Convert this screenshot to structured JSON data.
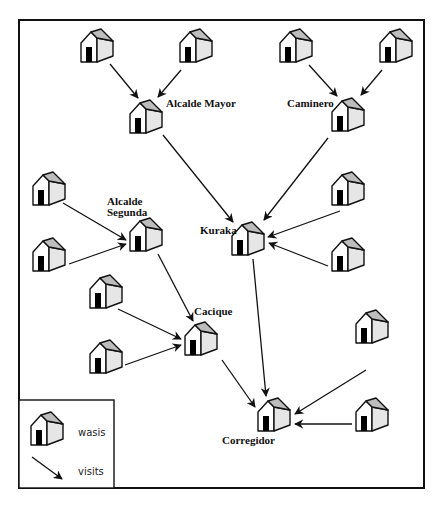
{
  "diagram": {
    "type": "network-flow",
    "colors": {
      "stroke": "#111111",
      "roof": "#bdbdbd",
      "side": "#e6e6e6",
      "door": "#000000",
      "background": "#ffffff"
    },
    "nodes": [
      {
        "id": "w1",
        "kind": "wasi",
        "x": 81,
        "y": 29
      },
      {
        "id": "w2",
        "kind": "wasi",
        "x": 180,
        "y": 29
      },
      {
        "id": "w3",
        "kind": "wasi",
        "x": 280,
        "y": 29
      },
      {
        "id": "w4",
        "kind": "wasi",
        "x": 380,
        "y": 29
      },
      {
        "id": "alcalde_mayor",
        "kind": "wasi",
        "x": 130,
        "y": 100,
        "label": "Alcalde Mayor"
      },
      {
        "id": "caminero",
        "kind": "wasi",
        "x": 332,
        "y": 98,
        "label": "Caminero"
      },
      {
        "id": "w5",
        "kind": "wasi",
        "x": 33,
        "y": 172
      },
      {
        "id": "w6",
        "kind": "wasi",
        "x": 33,
        "y": 238
      },
      {
        "id": "alcalde_segunda",
        "kind": "wasi",
        "x": 130,
        "y": 218,
        "label": "Alcalde Segunda"
      },
      {
        "id": "kuraka",
        "kind": "wasi",
        "x": 232,
        "y": 222,
        "label": "Kuraka"
      },
      {
        "id": "w7",
        "kind": "wasi",
        "x": 332,
        "y": 172
      },
      {
        "id": "w8",
        "kind": "wasi",
        "x": 332,
        "y": 238
      },
      {
        "id": "w9",
        "kind": "wasi",
        "x": 90,
        "y": 275
      },
      {
        "id": "w10",
        "kind": "wasi",
        "x": 90,
        "y": 340
      },
      {
        "id": "cacique",
        "kind": "wasi",
        "x": 185,
        "y": 322,
        "label": "Cacique"
      },
      {
        "id": "w11",
        "kind": "wasi",
        "x": 356,
        "y": 310
      },
      {
        "id": "w12",
        "kind": "wasi",
        "x": 356,
        "y": 398
      },
      {
        "id": "corregidor",
        "kind": "wasi",
        "x": 258,
        "y": 398,
        "label": "Corregidor"
      }
    ],
    "edges": [
      {
        "from": "w1",
        "to": "alcalde_mayor",
        "x1": 110,
        "y1": 64,
        "x2": 138,
        "y2": 98
      },
      {
        "from": "w2",
        "to": "alcalde_mayor",
        "x1": 181,
        "y1": 70,
        "x2": 158,
        "y2": 97
      },
      {
        "from": "w3",
        "to": "caminero",
        "x1": 309,
        "y1": 65,
        "x2": 337,
        "y2": 96
      },
      {
        "from": "w4",
        "to": "caminero",
        "x1": 382,
        "y1": 70,
        "x2": 361,
        "y2": 95
      },
      {
        "from": "alcalde_mayor",
        "to": "kuraka",
        "x1": 163,
        "y1": 135,
        "x2": 233,
        "y2": 222
      },
      {
        "from": "caminero",
        "to": "kuraka",
        "x1": 328,
        "y1": 138,
        "x2": 264,
        "y2": 220
      },
      {
        "from": "w5",
        "to": "alcalde_segunda",
        "x1": 63,
        "y1": 203,
        "x2": 126,
        "y2": 240
      },
      {
        "from": "w6",
        "to": "alcalde_segunda",
        "x1": 69,
        "y1": 264,
        "x2": 126,
        "y2": 244
      },
      {
        "from": "w7",
        "to": "kuraka",
        "x1": 340,
        "y1": 211,
        "x2": 268,
        "y2": 237
      },
      {
        "from": "w8",
        "to": "kuraka",
        "x1": 328,
        "y1": 266,
        "x2": 269,
        "y2": 243
      },
      {
        "from": "alcalde_segunda",
        "to": "cacique",
        "x1": 158,
        "y1": 254,
        "x2": 193,
        "y2": 321
      },
      {
        "from": "w9",
        "to": "cacique",
        "x1": 118,
        "y1": 309,
        "x2": 181,
        "y2": 339
      },
      {
        "from": "w10",
        "to": "cacique",
        "x1": 125,
        "y1": 365,
        "x2": 181,
        "y2": 345
      },
      {
        "from": "kuraka",
        "to": "corregidor",
        "x1": 253,
        "y1": 259,
        "x2": 266,
        "y2": 396
      },
      {
        "from": "cacique",
        "to": "corregidor",
        "x1": 222,
        "y1": 360,
        "x2": 255,
        "y2": 407
      },
      {
        "from": "w11",
        "to": "corregidor",
        "x1": 366,
        "y1": 370,
        "x2": 295,
        "y2": 414
      },
      {
        "from": "w12",
        "to": "corregidor",
        "x1": 352,
        "y1": 424,
        "x2": 295,
        "y2": 424
      }
    ],
    "labels": {
      "alcalde_mayor": "Alcalde Mayor",
      "caminero": "Caminero",
      "alcalde_segunda_line1": "Alcalde",
      "alcalde_segunda_line2": "Segunda",
      "kuraka": "Kuraka",
      "cacique": "Cacique",
      "corregidor": "Corregidor"
    },
    "legend": {
      "house_label": "wasis",
      "arrow_label": "visits"
    }
  }
}
